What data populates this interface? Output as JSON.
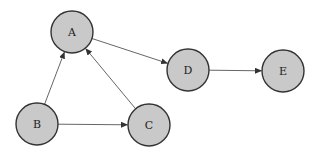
{
  "diagram": {
    "type": "directed-graph",
    "node_style": {
      "fill": "#c9c9c9",
      "stroke": "#333333",
      "radius": 21
    },
    "edge_color": "#555555",
    "nodes": [
      {
        "id": "A",
        "label": "A",
        "x": 72,
        "y": 32
      },
      {
        "id": "B",
        "label": "B",
        "x": 37,
        "y": 124
      },
      {
        "id": "C",
        "label": "C",
        "x": 149,
        "y": 125
      },
      {
        "id": "D",
        "label": "D",
        "x": 188,
        "y": 70
      },
      {
        "id": "E",
        "label": "E",
        "x": 283,
        "y": 71
      }
    ],
    "edges": [
      {
        "from": "A",
        "to": "D"
      },
      {
        "from": "B",
        "to": "A"
      },
      {
        "from": "B",
        "to": "C"
      },
      {
        "from": "C",
        "to": "A"
      },
      {
        "from": "D",
        "to": "E"
      }
    ]
  }
}
